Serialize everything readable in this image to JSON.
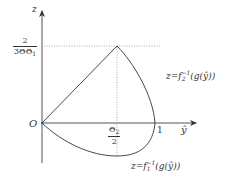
{
  "diagram": {
    "axes": {
      "vertical_label": "z",
      "horizontal_label": "ŷ",
      "origin_label": "O"
    },
    "ticks": {
      "z_peak": {
        "numerator": "2",
        "denominator": "3ΘΘ",
        "denominator_sub": "1"
      },
      "y_mid": {
        "numerator": "Θ",
        "numerator_sub": "2",
        "denominator": "2"
      },
      "y_one": "1"
    },
    "curves": {
      "upper": {
        "prefix": "z=f",
        "sub": "2",
        "sup": "−1",
        "suffix": "(g(ŷ))"
      },
      "lower": {
        "prefix": "z=f",
        "sub": "1",
        "sup": "−1",
        "suffix": "(g(ŷ))"
      }
    },
    "colors": {
      "stroke": "#333333",
      "dotted": "#888888",
      "background": "#ffffff"
    }
  }
}
